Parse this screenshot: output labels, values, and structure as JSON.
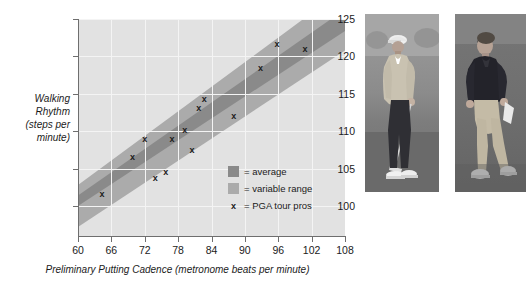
{
  "chart_data": {
    "type": "scatter",
    "title": "",
    "xlabel": "Preliminary Putting Cadence (metronome beats per minute)",
    "ylabel": "Walking Rhythm (steps per minute)",
    "xlim": [
      60,
      108
    ],
    "ylim": [
      96,
      125
    ],
    "y_axis_visible_min": 100,
    "grid": true,
    "legend_position": "inside-bottom-right",
    "xticks": [
      60,
      66,
      72,
      78,
      84,
      90,
      96,
      102,
      108
    ],
    "yticks": [
      100,
      105,
      110,
      115,
      120,
      125
    ],
    "series": [
      {
        "name": "PGA tour pros",
        "type": "scatter",
        "marker": "x",
        "color": "#1b1b1b",
        "points": [
          {
            "x": 64.3,
            "y": 101.6
          },
          {
            "x": 69.8,
            "y": 106.6
          },
          {
            "x": 72.0,
            "y": 108.9
          },
          {
            "x": 73.9,
            "y": 103.8
          },
          {
            "x": 75.8,
            "y": 104.6
          },
          {
            "x": 76.9,
            "y": 109.0
          },
          {
            "x": 79.2,
            "y": 110.2
          },
          {
            "x": 80.5,
            "y": 107.5
          },
          {
            "x": 81.7,
            "y": 113.1
          },
          {
            "x": 82.7,
            "y": 114.3
          },
          {
            "x": 88.0,
            "y": 112.0
          },
          {
            "x": 92.8,
            "y": 118.4
          },
          {
            "x": 95.8,
            "y": 121.6
          },
          {
            "x": 100.8,
            "y": 121.0
          }
        ]
      },
      {
        "name": "average",
        "type": "band",
        "color": "#8a8a8a",
        "x_start": 60,
        "x_end": 108,
        "y_upper_start": 101.4,
        "y_upper_end": 126.3,
        "y_lower_start": 100.0,
        "y_lower_end": 123.4
      },
      {
        "name": "variable range",
        "type": "band",
        "color": "#ababab",
        "x_start": 60,
        "x_end": 108,
        "y_upper_start": 102.8,
        "y_upper_end": 129.1,
        "y_lower_start": 97.2,
        "y_lower_end": 120.8
      }
    ],
    "legend": [
      {
        "label": "= average",
        "swatch": "#8a8a8a",
        "kind": "swatch"
      },
      {
        "label": "= variable range",
        "swatch": "#ababab",
        "kind": "swatch"
      },
      {
        "label": "= PGA tour pros",
        "swatch": "x",
        "kind": "marker"
      }
    ]
  },
  "axes": {
    "y_title": "Walking\nRhythm\n(steps per\nminute)",
    "y_title_lines": [
      "Walking",
      "Rhythm",
      "(steps per",
      "minute)"
    ],
    "x_title": "Preliminary Putting Cadence (metronome beats per minute)",
    "ytick_labels": [
      "125",
      "120",
      "115",
      "110",
      "105",
      "100"
    ],
    "xtick_labels": [
      "60",
      "66",
      "72",
      "78",
      "84",
      "90",
      "96",
      "102",
      "108"
    ]
  },
  "legend": {
    "rows": [
      {
        "marker": "",
        "label": "= average"
      },
      {
        "marker": "",
        "label": "= variable range"
      },
      {
        "marker": "x",
        "label": "= PGA tour pros"
      }
    ]
  },
  "photos": [
    {
      "caption": "",
      "alt_name": "golfer-standing-with-putter"
    },
    {
      "caption": "",
      "alt_name": "golfer-walking"
    }
  ],
  "colors": {
    "plot_background": "#e2e2e2",
    "band_average": "#8a8a8a",
    "band_variable_range": "#ababab",
    "marker": "#1b1b1b",
    "gridline": "#f4f4f4",
    "axis": "#6e6e6e"
  }
}
